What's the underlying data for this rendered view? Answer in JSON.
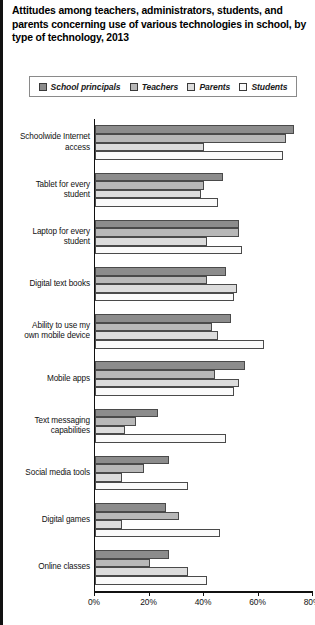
{
  "title": "Attitudes among teachers, administrators, students, and parents concerning use of various technologies in school, by type of technology, 2013",
  "legend": {
    "items": [
      {
        "label": "School principals",
        "swatch": "#8c8c8c",
        "icon": "legend-swatch-icon"
      },
      {
        "label": "Teachers",
        "swatch": "#b8b8b8",
        "icon": "legend-swatch-icon"
      },
      {
        "label": "Parents",
        "swatch": "#dcdcdc",
        "icon": "legend-swatch-icon"
      },
      {
        "label": "Students",
        "swatch": "#fafafa",
        "icon": "legend-swatch-icon"
      }
    ]
  },
  "chart_data": {
    "type": "bar",
    "orientation": "horizontal",
    "title": "Attitudes among teachers, administrators, students, and parents concerning use of various technologies in school, by type of technology, 2013",
    "xlabel": "",
    "ylabel": "",
    "xlim": [
      0,
      80
    ],
    "xticks": [
      0,
      20,
      40,
      60,
      80
    ],
    "xtick_labels": [
      "0%",
      "20%",
      "40%",
      "60%",
      "80%"
    ],
    "grid": false,
    "legend_position": "top",
    "categories": [
      "Schoolwide Internet access",
      "Tablet for every student",
      "Laptop for every student",
      "Digital text books",
      "Ability to use my own mobile device",
      "Mobile apps",
      "Text messaging capabilities",
      "Social media tools",
      "Digital games",
      "Online classes"
    ],
    "category_lines": [
      [
        "Schoolwide Internet",
        "access"
      ],
      [
        "Tablet for every",
        "student"
      ],
      [
        "Laptop for every",
        "student"
      ],
      [
        "Digital text books"
      ],
      [
        "Ability to use my",
        "own mobile device"
      ],
      [
        "Mobile apps"
      ],
      [
        "Text messaging",
        "capabilities"
      ],
      [
        "Social media tools"
      ],
      [
        "Digital games"
      ],
      [
        "Online classes"
      ]
    ],
    "series": [
      {
        "name": "School principals",
        "color": "#8c8c8c",
        "values": [
          73,
          47,
          53,
          48,
          50,
          55,
          23,
          27,
          26,
          27
        ]
      },
      {
        "name": "Teachers",
        "color": "#b8b8b8",
        "values": [
          70,
          40,
          53,
          41,
          43,
          44,
          15,
          18,
          31,
          20
        ]
      },
      {
        "name": "Parents",
        "color": "#dcdcdc",
        "values": [
          40,
          39,
          41,
          52,
          45,
          53,
          11,
          10,
          10,
          34
        ]
      },
      {
        "name": "Students",
        "color": "#fafafa",
        "values": [
          69,
          45,
          54,
          51,
          62,
          51,
          48,
          34,
          46,
          41
        ]
      }
    ]
  }
}
